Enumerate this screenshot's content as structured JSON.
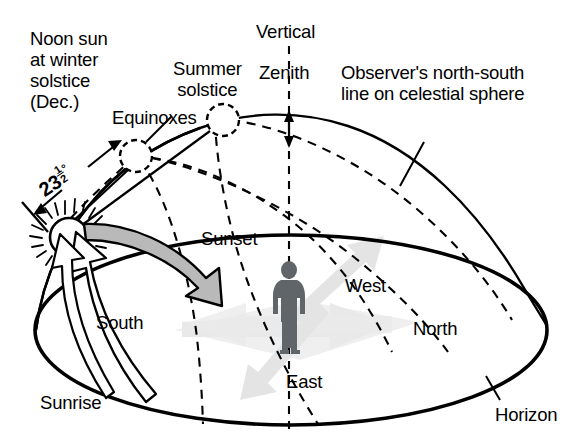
{
  "figure": {
    "kind": "astronomy-diagram",
    "background_color": "#ffffff",
    "ink_color": "#000000"
  },
  "labels": {
    "noon_sun_winter": {
      "line1": "Noon sun",
      "line2": "at winter",
      "line3": "solstice",
      "line4": "(Dec.)"
    },
    "summer_solstice": {
      "line1": "Summer",
      "line2": "solstice"
    },
    "equinoxes": "Equinoxes",
    "vertical": "Vertical",
    "zenith": "Zenith",
    "observer_line": {
      "line1": "Observer's north-south",
      "line2": "line on celestial sphere"
    },
    "sunset": "Sunset",
    "sunrise": "Sunrise",
    "west": "West",
    "north": "North",
    "south": "South",
    "east": "East",
    "horizon": "Horizon",
    "tilt_angle": {
      "value": "23",
      "fraction_numerator": "1",
      "fraction_denominator": "2",
      "degree_symbol": "°",
      "full_text": "23 1/2°"
    }
  },
  "colors": {
    "outline": "#000000",
    "sunset_arrow_fill": "#b9b9b9",
    "sunrise_arrow_fill": "#ffffff",
    "observer_figure": "#5f6568",
    "compass_arrow_fill": "#e9e9e9",
    "compass_arrow_shadow": "#dcdcdc"
  },
  "elements": {
    "sun_icon": "sun-with-rays",
    "equinox_node": "dashed-circle",
    "summer_solstice_node": "dashed-circle",
    "zenith_marker": "double-headed-arrow",
    "horizon_plane": "ellipse",
    "meridian_arc": "solid-arc",
    "sun_paths": "three-dashed-arcs",
    "observer": "human-silhouette",
    "compass_rose": "four-way-gray-arrows"
  }
}
